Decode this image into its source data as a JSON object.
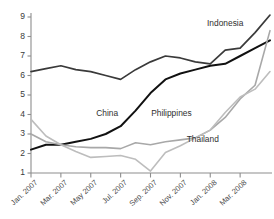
{
  "chart_data": {
    "type": "line",
    "title": "",
    "xlabel": "",
    "ylabel": "",
    "ylim": [
      1,
      9
    ],
    "grid": false,
    "legend_position": "inline-labels",
    "y_ticks": [
      "1",
      "2",
      "3",
      "4",
      "5",
      "6",
      "7",
      "8",
      "9"
    ],
    "x": [
      "Jan. 2007",
      "Feb. 2007",
      "Mar. 2007",
      "Apr. 2007",
      "May 2007",
      "Jun. 2007",
      "Jul. 2007",
      "Aug. 2007",
      "Sep. 2007",
      "Oct. 2007",
      "Nov. 2007",
      "Dec. 2007",
      "Jan. 2008",
      "Feb. 2008",
      "Mar. 2008",
      "Apr. 2008",
      "May 2008"
    ],
    "x_tick_labels": [
      "Jan. 2007",
      "Mar. 2007",
      "May 2007",
      "Jul. 2007",
      "Sep. 2007",
      "Nov. 2007",
      "Jan. 2008",
      "Mar. 2008"
    ],
    "x_tick_indices": [
      0,
      2,
      4,
      6,
      8,
      10,
      12,
      14
    ],
    "series": [
      {
        "name": "Indonesia",
        "color": "#3a3a3a",
        "width": 1.7,
        "label_x_index": 13.0,
        "label_y_value": 8.55,
        "values": [
          6.2,
          6.35,
          6.5,
          6.3,
          6.2,
          6.0,
          5.8,
          6.3,
          6.7,
          7.0,
          6.9,
          6.7,
          6.6,
          7.3,
          7.4,
          8.2,
          9.1
        ]
      },
      {
        "name": "China",
        "color": "#111111",
        "width": 2.0,
        "label_x_index": 5.1,
        "label_y_value": 3.9,
        "values": [
          2.2,
          2.45,
          2.45,
          2.6,
          2.75,
          3.0,
          3.4,
          4.2,
          5.1,
          5.8,
          6.1,
          6.3,
          6.5,
          6.6,
          7.0,
          7.4,
          7.8
        ]
      },
      {
        "name": "Philippines",
        "color": "#a8a8a8",
        "width": 1.6,
        "label_x_index": 9.4,
        "label_y_value": 3.9,
        "values": [
          3.0,
          2.6,
          2.45,
          2.35,
          2.3,
          2.3,
          2.25,
          2.55,
          2.45,
          2.6,
          2.7,
          2.8,
          3.2,
          3.85,
          4.8,
          5.5,
          8.3
        ]
      },
      {
        "name": "Thailand",
        "color": "#bdbdbd",
        "width": 1.6,
        "label_x_index": 11.5,
        "label_y_value": 2.6,
        "values": [
          3.75,
          2.9,
          2.45,
          2.1,
          1.8,
          1.85,
          1.9,
          1.7,
          1.1,
          2.05,
          2.4,
          2.8,
          3.2,
          4.1,
          4.9,
          5.3,
          6.2
        ]
      }
    ]
  }
}
